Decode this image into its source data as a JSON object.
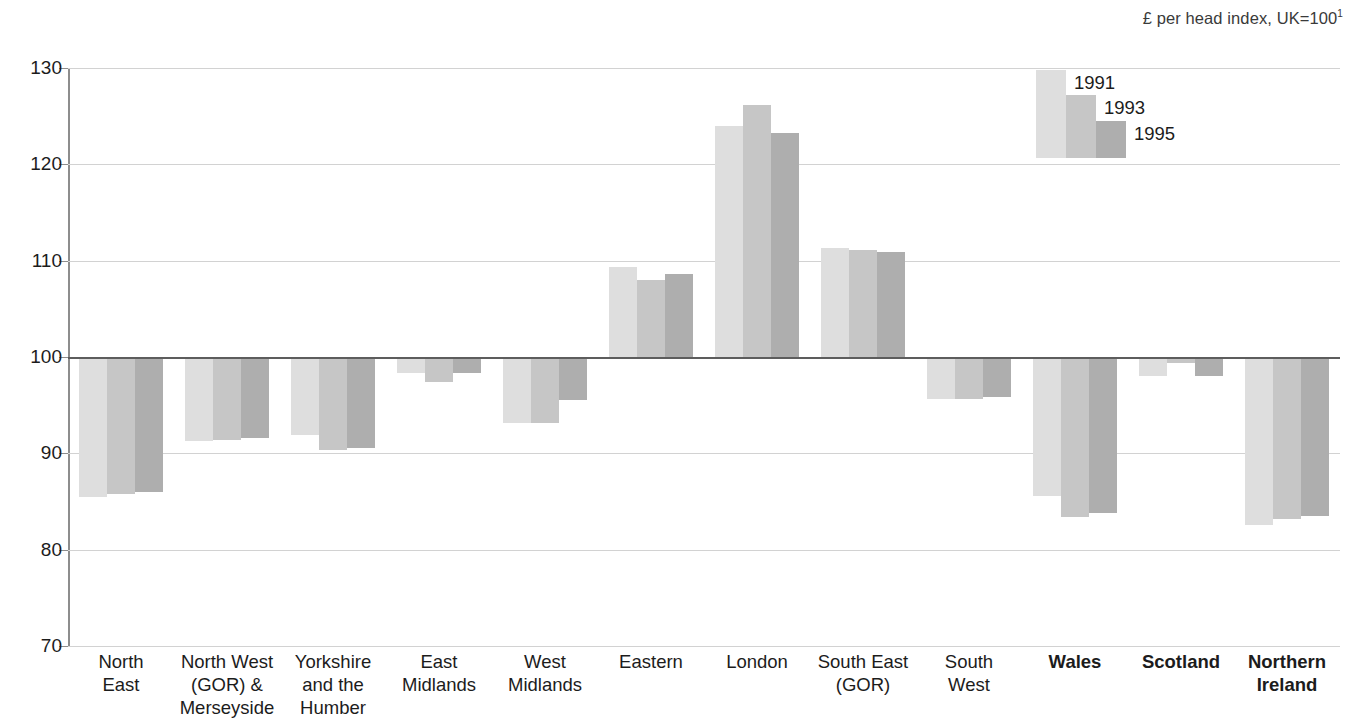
{
  "header": {
    "note_text": "£ per head index, UK=100",
    "note_footnote": "1"
  },
  "legend": {
    "title": "",
    "entries": [
      {
        "label": "1991",
        "color": "#dedede"
      },
      {
        "label": "1993",
        "color": "#c6c6c6"
      },
      {
        "label": "1995",
        "color": "#aeaeae"
      }
    ]
  },
  "axis": {
    "y_ticks": [
      "130",
      "120",
      "110",
      "100",
      "90",
      "80",
      "70"
    ],
    "baseline_label": "100"
  },
  "chart_data": {
    "type": "bar",
    "title": "",
    "subtitle": "",
    "annotation": "£ per head index, UK=100¹",
    "xlabel": "",
    "ylabel": "",
    "ylim": [
      70,
      130
    ],
    "ytick_step": 10,
    "grid": true,
    "baseline": 100,
    "legend_position": "top-right",
    "orientation": "vertical",
    "categories": [
      "North\nEast",
      "North West\n(GOR) &\nMerseyside",
      "Yorkshire\nand the\nHumber",
      "East\nMidlands",
      "West\nMidlands",
      "Eastern",
      "London",
      "South East\n(GOR)",
      "South\nWest",
      "Wales",
      "Scotland",
      "Northern\nIreland"
    ],
    "categories_bold": [
      false,
      false,
      false,
      false,
      false,
      false,
      false,
      false,
      false,
      true,
      true,
      true
    ],
    "series": [
      {
        "name": "1991",
        "color": "#dedede",
        "values": [
          85.5,
          91.3,
          91.9,
          98.3,
          93.2,
          109.3,
          124.0,
          111.3,
          95.6,
          85.6,
          98.0,
          82.6
        ]
      },
      {
        "name": "1993",
        "color": "#c6c6c6",
        "values": [
          85.8,
          91.4,
          90.3,
          97.4,
          93.2,
          108.0,
          126.2,
          111.1,
          95.6,
          83.4,
          99.4,
          83.2
        ]
      },
      {
        "name": "1995",
        "color": "#aeaeae",
        "values": [
          86.0,
          91.6,
          90.6,
          98.3,
          95.5,
          108.6,
          123.3,
          110.9,
          95.8,
          83.8,
          98.0,
          83.5
        ]
      }
    ]
  }
}
